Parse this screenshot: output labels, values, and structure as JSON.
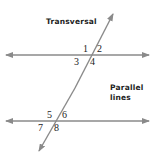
{
  "labels": {
    "transversal": "Transversal",
    "parallel_line1": "Parallel",
    "parallel_line2": "lines"
  },
  "angles": {
    "a1": "1",
    "a2": "2",
    "a3": "3",
    "a4": "4",
    "a5": "5",
    "a6": "6",
    "a7": "7",
    "a8": "8"
  },
  "colors": {
    "line": "#8a8a8a",
    "text": "#222222"
  }
}
